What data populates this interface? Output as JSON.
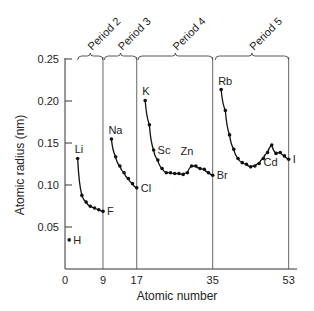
{
  "chart_data": {
    "type": "line",
    "title": "",
    "xlabel": "Atomic number",
    "ylabel": "Atomic radius (nm)",
    "xlim": [
      0,
      53
    ],
    "ylim": [
      0,
      0.25
    ],
    "grid": false,
    "x_ticks": [
      0,
      9,
      17,
      35,
      53
    ],
    "x_tick_labels": [
      "0",
      "9",
      "17",
      "35",
      "53"
    ],
    "y_ticks": [
      0.05,
      0.1,
      0.15,
      0.2,
      0.25
    ],
    "y_tick_labels": [
      "0.05",
      "0.10",
      "0.15",
      "0.20",
      "0.25"
    ],
    "period_boundaries": [
      9,
      17,
      35,
      53
    ],
    "periods": [
      {
        "name": "Period 2",
        "from": 3,
        "to": 9
      },
      {
        "name": "Period 3",
        "from": 11,
        "to": 17
      },
      {
        "name": "Period 4",
        "from": 19,
        "to": 35
      },
      {
        "name": "Period 5",
        "from": 37,
        "to": 53
      }
    ],
    "series": [
      {
        "name": "Period 1",
        "x": [
          1
        ],
        "values": [
          0.037
        ]
      },
      {
        "name": "Period 2",
        "x": [
          3,
          4,
          5,
          6,
          7,
          8,
          9
        ],
        "values": [
          0.134,
          0.09,
          0.082,
          0.077,
          0.075,
          0.073,
          0.071
        ]
      },
      {
        "name": "Period 3",
        "x": [
          11,
          12,
          13,
          14,
          15,
          16,
          17
        ],
        "values": [
          0.157,
          0.136,
          0.125,
          0.117,
          0.11,
          0.104,
          0.099
        ]
      },
      {
        "name": "Period 4",
        "x": [
          19,
          20,
          21,
          22,
          23,
          24,
          25,
          26,
          27,
          28,
          29,
          30,
          31,
          32,
          33,
          34,
          35
        ],
        "values": [
          0.203,
          0.174,
          0.144,
          0.132,
          0.122,
          0.117,
          0.117,
          0.116,
          0.116,
          0.115,
          0.117,
          0.125,
          0.125,
          0.122,
          0.121,
          0.117,
          0.114
        ]
      },
      {
        "name": "Period 5",
        "x": [
          37,
          38,
          39,
          40,
          41,
          42,
          43,
          44,
          45,
          46,
          47,
          48,
          49,
          50,
          51,
          52,
          53
        ],
        "values": [
          0.216,
          0.191,
          0.162,
          0.145,
          0.134,
          0.129,
          0.127,
          0.124,
          0.125,
          0.128,
          0.134,
          0.141,
          0.15,
          0.14,
          0.141,
          0.137,
          0.133
        ]
      }
    ],
    "annotations": [
      {
        "text": "H",
        "x": 1,
        "y": 0.037,
        "pos": "right"
      },
      {
        "text": "Li",
        "x": 3,
        "y": 0.134,
        "pos": "above"
      },
      {
        "text": "F",
        "x": 9,
        "y": 0.071,
        "pos": "right"
      },
      {
        "text": "Na",
        "x": 11,
        "y": 0.157,
        "pos": "above"
      },
      {
        "text": "Cl",
        "x": 17,
        "y": 0.099,
        "pos": "right"
      },
      {
        "text": "K",
        "x": 19,
        "y": 0.203,
        "pos": "above"
      },
      {
        "text": "Sc",
        "x": 21,
        "y": 0.144,
        "pos": "right"
      },
      {
        "text": "Zn",
        "x": 30,
        "y": 0.125,
        "pos": "above"
      },
      {
        "text": "Br",
        "x": 35,
        "y": 0.114,
        "pos": "right"
      },
      {
        "text": "Rb",
        "x": 37,
        "y": 0.216,
        "pos": "above"
      },
      {
        "text": "Cd",
        "x": 48,
        "y": 0.141,
        "pos": "below"
      },
      {
        "text": "I",
        "x": 53,
        "y": 0.133,
        "pos": "right"
      }
    ]
  }
}
